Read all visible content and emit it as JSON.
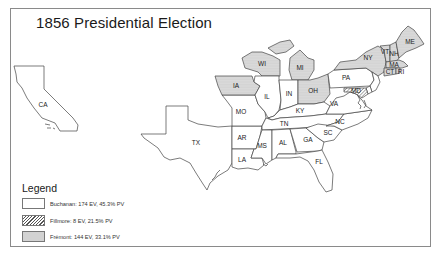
{
  "map": {
    "title": "1856 Presidential Election",
    "colors": {
      "border": "#8a8a8a",
      "stroke": "#444444",
      "buchanan_fill": "#ffffff",
      "fremont_fill": "#e9e9e9"
    },
    "states": {
      "CA": {
        "label": "CA",
        "winner": "Buchanan"
      },
      "TX": {
        "label": "TX",
        "winner": "Buchanan"
      },
      "IA": {
        "label": "IA",
        "winner": "Frémont"
      },
      "WI": {
        "label": "WI",
        "winner": "Frémont"
      },
      "MI": {
        "label": "MI",
        "winner": "Frémont"
      },
      "IL": {
        "label": "IL",
        "winner": "Buchanan"
      },
      "IN": {
        "label": "IN",
        "winner": "Buchanan"
      },
      "OH": {
        "label": "OH",
        "winner": "Frémont"
      },
      "MO": {
        "label": "MO",
        "winner": "Buchanan"
      },
      "KY": {
        "label": "KY",
        "winner": "Buchanan"
      },
      "PA": {
        "label": "PA",
        "winner": "Buchanan"
      },
      "NY": {
        "label": "NY",
        "winner": "Frémont"
      },
      "VT": {
        "label": "VT",
        "winner": "Frémont"
      },
      "NH": {
        "label": "NH",
        "winner": "Frémont"
      },
      "ME": {
        "label": "ME",
        "winner": "Frémont"
      },
      "MA": {
        "label": "MA",
        "winner": "Frémont"
      },
      "CT": {
        "label": "CT",
        "winner": "Frémont"
      },
      "RI": {
        "label": "RI",
        "winner": "Frémont"
      },
      "MD": {
        "label": "MD",
        "winner": "Fillmore"
      },
      "DE": {
        "label": "DE",
        "winner": "Buchanan"
      },
      "NJ": {
        "label": "NJ",
        "winner": "Buchanan"
      },
      "VA": {
        "label": "VA",
        "winner": "Buchanan"
      },
      "NC": {
        "label": "NC",
        "winner": "Buchanan"
      },
      "TN": {
        "label": "TN",
        "winner": "Buchanan"
      },
      "AR": {
        "label": "AR",
        "winner": "Buchanan"
      },
      "LA": {
        "label": "LA",
        "winner": "Buchanan"
      },
      "MS": {
        "label": "MS",
        "winner": "Buchanan"
      },
      "AL": {
        "label": "AL",
        "winner": "Buchanan"
      },
      "GA": {
        "label": "GA",
        "winner": "Buchanan"
      },
      "SC": {
        "label": "SC",
        "winner": "Buchanan"
      },
      "FL": {
        "label": "FL",
        "winner": "Buchanan"
      }
    }
  },
  "legend": {
    "title": "Legend",
    "items": [
      {
        "label": "Buchanan: 174 EV, 45.3% PV",
        "pattern": "plain"
      },
      {
        "label": "Fillmore: 8 EV, 21.5% PV",
        "pattern": "hatched"
      },
      {
        "label": "Frémont: 144 EV, 33.1% PV",
        "pattern": "dotted"
      }
    ]
  }
}
